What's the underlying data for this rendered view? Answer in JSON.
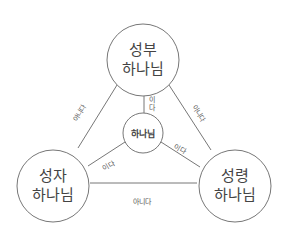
{
  "nodes": {
    "father": {
      "line1": "성부",
      "line2": "하나님"
    },
    "son": {
      "line1": "성자",
      "line2": "하나님"
    },
    "spirit": {
      "line1": "성령",
      "line2": "하나님"
    },
    "god": {
      "label": "하나님"
    }
  },
  "edges": {
    "father_son": "아니다",
    "father_spirit": "아니다",
    "son_spirit": "아니다",
    "father_god": "이다",
    "son_god": "이다",
    "spirit_god": "이다"
  },
  "colors": {
    "stroke": "#777777",
    "text": "#444444"
  }
}
